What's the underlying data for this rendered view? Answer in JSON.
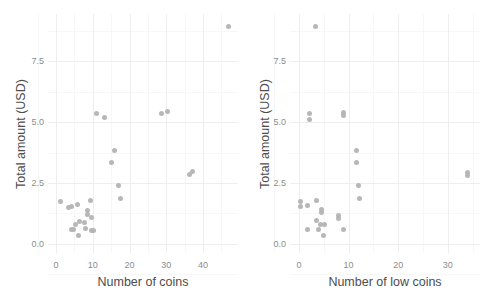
{
  "figure": {
    "background_color": "#ffffff",
    "point_color": "#b3b3b3",
    "grid_color": "#f2f2f2",
    "axis_text_color": "#8c8c8c",
    "axis_title_color": "#4d4d4d"
  },
  "chart_data": [
    {
      "type": "scatter",
      "panel": "left",
      "title": "",
      "xlabel": "Number of coins",
      "ylabel": "Total amount (USD)",
      "xlim": [
        -2.2,
        49.5
      ],
      "ylim": [
        -0.38,
        9.45
      ],
      "xticks": [
        0,
        10,
        20,
        30,
        40
      ],
      "xticklabels": [
        "0",
        "10",
        "20",
        "30",
        "40"
      ],
      "yticks": [
        0.0,
        2.5,
        5.0,
        7.5
      ],
      "yticklabels": [
        "0.0",
        "2.5",
        "5.0",
        "7.5"
      ],
      "grid": true,
      "legend": "none",
      "points": [
        {
          "x": 47.0,
          "y": 8.95
        },
        {
          "x": 11.0,
          "y": 5.35
        },
        {
          "x": 13.2,
          "y": 5.18
        },
        {
          "x": 28.6,
          "y": 5.35
        },
        {
          "x": 30.4,
          "y": 5.45
        },
        {
          "x": 15.8,
          "y": 3.85
        },
        {
          "x": 15.0,
          "y": 3.33
        },
        {
          "x": 36.3,
          "y": 2.85
        },
        {
          "x": 37.0,
          "y": 2.97
        },
        {
          "x": 17.0,
          "y": 2.38
        },
        {
          "x": 17.6,
          "y": 1.85
        },
        {
          "x": 1.2,
          "y": 1.72
        },
        {
          "x": 9.3,
          "y": 1.8
        },
        {
          "x": 4.2,
          "y": 1.55
        },
        {
          "x": 5.9,
          "y": 1.62
        },
        {
          "x": 3.4,
          "y": 1.48
        },
        {
          "x": 8.5,
          "y": 1.37
        },
        {
          "x": 8.6,
          "y": 1.22
        },
        {
          "x": 9.6,
          "y": 1.08
        },
        {
          "x": 6.3,
          "y": 0.92
        },
        {
          "x": 7.6,
          "y": 0.88
        },
        {
          "x": 5.4,
          "y": 0.78
        },
        {
          "x": 4.1,
          "y": 0.6
        },
        {
          "x": 4.8,
          "y": 0.58
        },
        {
          "x": 8.1,
          "y": 0.62
        },
        {
          "x": 9.5,
          "y": 0.55
        },
        {
          "x": 10.2,
          "y": 0.55
        },
        {
          "x": 6.0,
          "y": 0.34
        }
      ]
    },
    {
      "type": "scatter",
      "panel": "right",
      "title": "",
      "xlabel": "Number of low coins",
      "ylabel": "Total amount (USD)",
      "xlim": [
        -1.8,
        36.5
      ],
      "ylim": [
        -0.38,
        9.45
      ],
      "xticks": [
        0,
        10,
        20,
        30
      ],
      "xticklabels": [
        "0",
        "10",
        "20",
        "30"
      ],
      "yticks": [
        0.0,
        2.5,
        5.0,
        7.5
      ],
      "yticklabels": [
        "0.0",
        "2.5",
        "5.0",
        "7.5"
      ],
      "grid": true,
      "legend": "none",
      "points": [
        {
          "x": 3.4,
          "y": 8.95
        },
        {
          "x": 2.2,
          "y": 5.35
        },
        {
          "x": 2.2,
          "y": 5.12
        },
        {
          "x": 9.0,
          "y": 5.42
        },
        {
          "x": 9.0,
          "y": 5.28
        },
        {
          "x": 11.6,
          "y": 3.85
        },
        {
          "x": 11.6,
          "y": 3.33
        },
        {
          "x": 34.0,
          "y": 2.92
        },
        {
          "x": 34.0,
          "y": 2.82
        },
        {
          "x": 12.0,
          "y": 2.38
        },
        {
          "x": 12.2,
          "y": 1.85
        },
        {
          "x": 0.3,
          "y": 1.72
        },
        {
          "x": 0.3,
          "y": 1.52
        },
        {
          "x": 3.6,
          "y": 1.8
        },
        {
          "x": 1.8,
          "y": 1.58
        },
        {
          "x": 4.6,
          "y": 1.42
        },
        {
          "x": 4.6,
          "y": 1.3
        },
        {
          "x": 8.0,
          "y": 1.18
        },
        {
          "x": 8.0,
          "y": 1.03
        },
        {
          "x": 3.5,
          "y": 0.95
        },
        {
          "x": 4.4,
          "y": 0.8
        },
        {
          "x": 5.2,
          "y": 0.78
        },
        {
          "x": 1.7,
          "y": 0.6
        },
        {
          "x": 4.0,
          "y": 0.6
        },
        {
          "x": 8.9,
          "y": 0.58
        },
        {
          "x": 5.0,
          "y": 0.36
        }
      ]
    }
  ]
}
